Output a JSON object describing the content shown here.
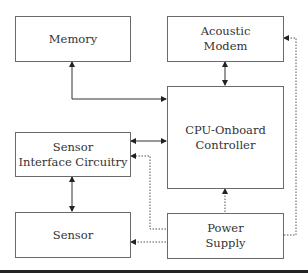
{
  "diagram": {
    "type": "block-diagram",
    "blocks": {
      "memory": {
        "label": "Memory"
      },
      "acoustic_modem": {
        "label": "Acoustic\nModem"
      },
      "cpu": {
        "label": "CPU-Onboard\nController"
      },
      "sensor_interface": {
        "label": "Sensor\nInterface Circuitry"
      },
      "sensor": {
        "label": "Sensor"
      },
      "power_supply": {
        "label": "Power\nSupply"
      }
    },
    "connections": [
      {
        "from": "memory",
        "to": "cpu",
        "style": "solid",
        "direction": "bidirectional"
      },
      {
        "from": "acoustic_modem",
        "to": "cpu",
        "style": "solid",
        "direction": "bidirectional"
      },
      {
        "from": "sensor_interface",
        "to": "cpu",
        "style": "solid",
        "direction": "bidirectional"
      },
      {
        "from": "sensor_interface",
        "to": "sensor",
        "style": "solid",
        "direction": "bidirectional"
      },
      {
        "from": "power_supply",
        "to": "cpu",
        "style": "dotted",
        "direction": "forward"
      },
      {
        "from": "power_supply",
        "to": "sensor_interface",
        "style": "dotted",
        "direction": "forward"
      },
      {
        "from": "power_supply",
        "to": "sensor",
        "style": "dotted",
        "direction": "forward"
      },
      {
        "from": "power_supply",
        "to": "acoustic_modem",
        "style": "dotted",
        "direction": "forward"
      }
    ],
    "colors": {
      "line": "#333333",
      "border": "#6a6a6a",
      "text": "#333333"
    }
  }
}
